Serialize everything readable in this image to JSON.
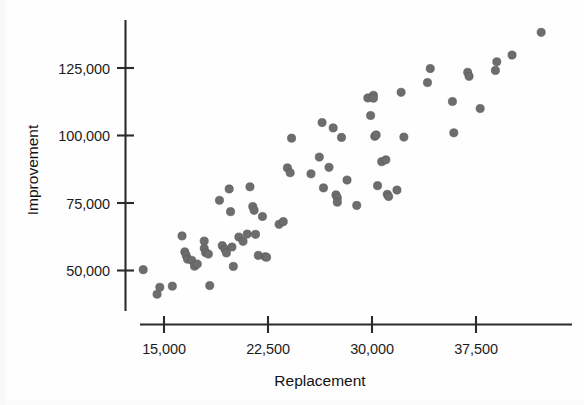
{
  "figure": {
    "background_color": "#fefefe",
    "marker_color": "#6d6d6d",
    "axis_color": "#2b2b2b"
  },
  "axes": {
    "x_title": "Replacement",
    "y_title": "Improvement",
    "x_ticks": [
      "15,000",
      "22,500",
      "30,000",
      "37,500"
    ],
    "y_ticks": [
      "50,000",
      "75,000",
      "100,000",
      "125,000"
    ]
  },
  "chart_data": {
    "type": "scatter",
    "title": "",
    "xlabel": "Replacement",
    "ylabel": "Improvement",
    "xlim": [
      12500,
      43000
    ],
    "ylim": [
      38000,
      142000
    ],
    "xticks": [
      15000,
      22500,
      30000,
      37500
    ],
    "yticks": [
      50000,
      75000,
      100000,
      125000
    ],
    "xtick_labels": [
      "15,000",
      "22,500",
      "30,000",
      "37,500"
    ],
    "ytick_labels": [
      "50,000",
      "75,000",
      "100,000",
      "125,000"
    ],
    "grid": false,
    "legend": null,
    "series": [
      {
        "name": "Buildings",
        "marker": "filled-circle",
        "color": "#6d6d6d",
        "points": [
          [
            13500,
            50300
          ],
          [
            14500,
            41200
          ],
          [
            14700,
            43800
          ],
          [
            15600,
            44200
          ],
          [
            16300,
            62800
          ],
          [
            16500,
            56900
          ],
          [
            16600,
            55600
          ],
          [
            16700,
            54200
          ],
          [
            17000,
            53800
          ],
          [
            17200,
            51600
          ],
          [
            17400,
            52400
          ],
          [
            17900,
            60900
          ],
          [
            17900,
            58200
          ],
          [
            18000,
            56600
          ],
          [
            18200,
            56100
          ],
          [
            18300,
            44400
          ],
          [
            19000,
            76000
          ],
          [
            19200,
            59200
          ],
          [
            19400,
            57800
          ],
          [
            19500,
            56500
          ],
          [
            19700,
            80200
          ],
          [
            19800,
            71800
          ],
          [
            19900,
            58700
          ],
          [
            20000,
            51500
          ],
          [
            20400,
            62400
          ],
          [
            20700,
            60800
          ],
          [
            21000,
            63500
          ],
          [
            21200,
            81000
          ],
          [
            21400,
            73700
          ],
          [
            21500,
            72300
          ],
          [
            21600,
            63400
          ],
          [
            21800,
            55600
          ],
          [
            22100,
            70000
          ],
          [
            22300,
            55100
          ],
          [
            22400,
            54900
          ],
          [
            23300,
            67100
          ],
          [
            23600,
            68100
          ],
          [
            23900,
            88000
          ],
          [
            24100,
            86200
          ],
          [
            24200,
            99000
          ],
          [
            25600,
            85800
          ],
          [
            26200,
            92000
          ],
          [
            26400,
            104800
          ],
          [
            26500,
            80600
          ],
          [
            26900,
            88200
          ],
          [
            27200,
            102800
          ],
          [
            27400,
            78000
          ],
          [
            27500,
            76900
          ],
          [
            27500,
            75300
          ],
          [
            27800,
            99300
          ],
          [
            28200,
            83500
          ],
          [
            28900,
            74100
          ],
          [
            29700,
            113900
          ],
          [
            29900,
            107400
          ],
          [
            30100,
            114900
          ],
          [
            30100,
            113800
          ],
          [
            30200,
            99700
          ],
          [
            30300,
            100200
          ],
          [
            30400,
            81400
          ],
          [
            30700,
            90300
          ],
          [
            31000,
            91000
          ],
          [
            31100,
            78200
          ],
          [
            31200,
            77400
          ],
          [
            31800,
            79800
          ],
          [
            32100,
            116000
          ],
          [
            32300,
            99400
          ],
          [
            34000,
            119600
          ],
          [
            34200,
            124800
          ],
          [
            35800,
            112600
          ],
          [
            35900,
            101000
          ],
          [
            36900,
            123400
          ],
          [
            37000,
            121900
          ],
          [
            37800,
            110000
          ],
          [
            38900,
            124100
          ],
          [
            39000,
            127300
          ],
          [
            40100,
            129800
          ],
          [
            42200,
            138200
          ]
        ]
      }
    ]
  }
}
